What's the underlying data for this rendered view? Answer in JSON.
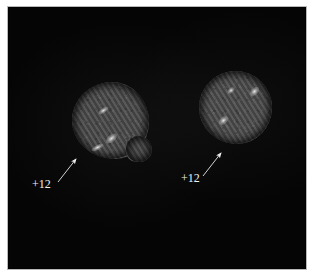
{
  "figure": {
    "kind": "electron-micrograph",
    "background_color": "#050505",
    "page_color": "#ffffff",
    "frame_color": "#b9b9b9",
    "panel": {
      "x": 9,
      "y": 8,
      "width": 296,
      "height": 260
    }
  },
  "cells": [
    {
      "id": "cell-left",
      "name": "left-cell",
      "center_x": 110,
      "center_y": 120,
      "radius_x": 38,
      "radius_y": 38,
      "fill_color": "#4a4a4a",
      "stripe_angle_deg": 58,
      "foci": [
        {
          "name": "bright-focus-upper",
          "cx": 97,
          "cy": 105,
          "rx": 4.5,
          "ry": 2.0,
          "rot": -35
        },
        {
          "name": "bright-focus-center",
          "cx": 106,
          "cy": 133,
          "rx": 5.0,
          "ry": 2.6,
          "rot": -40
        },
        {
          "name": "bright-focus-lower-left",
          "cx": 92,
          "cy": 142,
          "rx": 5.0,
          "ry": 2.0,
          "rot": -30
        }
      ]
    },
    {
      "id": "cell-right",
      "name": "right-cell",
      "center_x": 235,
      "center_y": 108,
      "radius_x": 36,
      "radius_y": 36,
      "fill_color": "#4c4c4c",
      "stripe_angle_deg": 58,
      "foci": [
        {
          "name": "bright-focus-top",
          "cx": 234,
          "cy": 92,
          "rx": 3.0,
          "ry": 2.0,
          "rot": -40
        },
        {
          "name": "bright-focus-right",
          "cx": 258,
          "cy": 94,
          "rx": 4.0,
          "ry": 2.6,
          "rot": -45
        },
        {
          "name": "bright-focus-lower",
          "cx": 227,
          "cy": 122,
          "rx": 4.0,
          "ry": 2.6,
          "rot": -40
        }
      ]
    }
  ],
  "annotations": [
    {
      "id": "annotation-left",
      "name": "annotation-plus-12-left",
      "label": "+12",
      "label_x": 32,
      "label_y": 178,
      "arrow_from_x": 58,
      "arrow_from_y": 182,
      "arrow_to_x": 77,
      "arrow_to_y": 158,
      "color": "#f2f2f2"
    },
    {
      "id": "annotation-right",
      "name": "annotation-plus-12-right",
      "label": "+12",
      "label_x": 181,
      "label_y": 172,
      "arrow_from_x": 203,
      "arrow_from_y": 176,
      "arrow_to_x": 222,
      "arrow_to_y": 152,
      "color": "#f2f2f2"
    }
  ]
}
